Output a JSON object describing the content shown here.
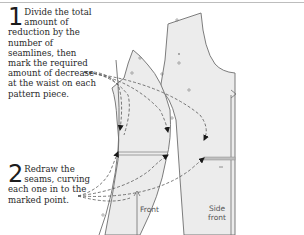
{
  "steps": [
    {
      "number": "1",
      "text": "Divide the total amount of reduction by the number of seamlines, then mark the required amount of decrease at the waist on each pattern piece."
    },
    {
      "number": "2",
      "text": "Redraw the seams, curving each one in to the marked point."
    }
  ],
  "labels": {
    "front": "Front",
    "side_front_line1": "Side",
    "side_front_line2": "front"
  },
  "colors": {
    "pattern_fill": "#ececec",
    "pattern_stroke": "#6e6e6e",
    "dashed_arrow": "#555555",
    "text": "#2a2a2a"
  }
}
